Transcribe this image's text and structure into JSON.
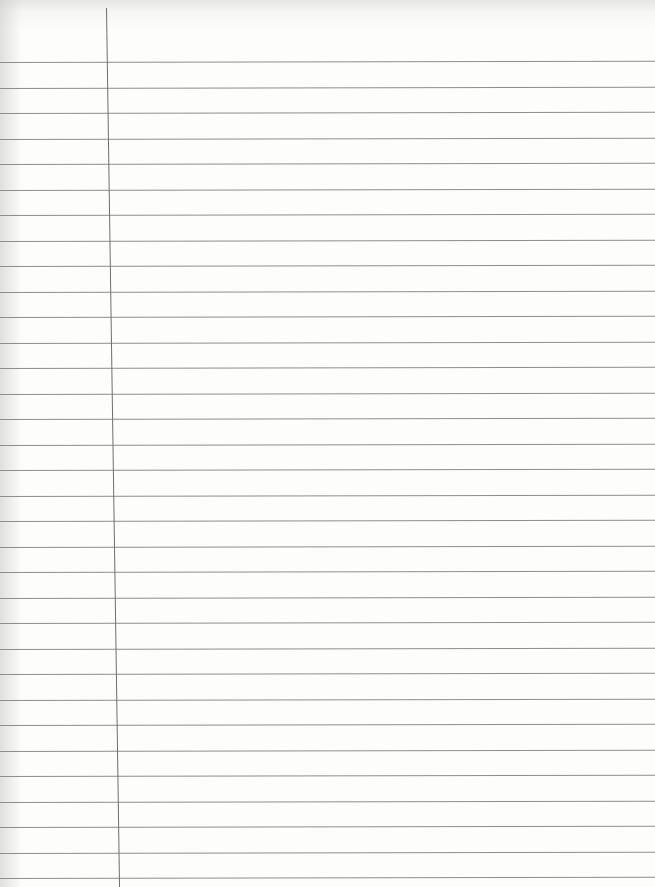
{
  "paper": {
    "type": "lined-notebook-page",
    "background_color": "#fdfdfc",
    "rule_color": "#8e8e8e",
    "margin_color": "#6e6e70",
    "first_rule_y": 62,
    "rule_spacing": 25.5,
    "rule_count": 33,
    "margin_top_x": 106,
    "margin_bottom_x": 119
  }
}
